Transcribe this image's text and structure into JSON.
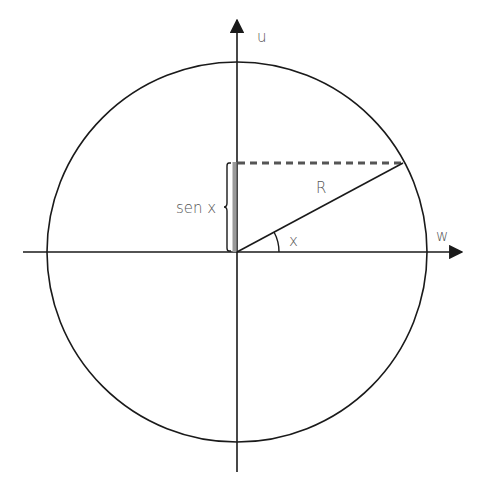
{
  "diagram": {
    "type": "unit-circle-sine",
    "labels": {
      "vertical_axis": "u",
      "horizontal_axis": "w",
      "radius": "R",
      "angle": "x",
      "sine": "sen x"
    },
    "geometry": {
      "center": [
        237,
        252
      ],
      "radius": 189,
      "point_on_circle": [
        403,
        163
      ]
    },
    "colors": {
      "stroke": "#1a1a1a",
      "label": "#555555",
      "dashed": "#555555",
      "sine_bar": "#9a9a9a"
    }
  }
}
